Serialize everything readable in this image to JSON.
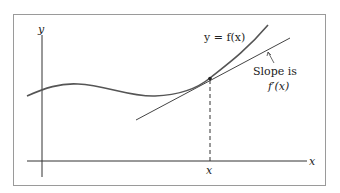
{
  "diagram": {
    "type": "tangent-line-illustration",
    "curve_label": "y = f(x)",
    "tangent_label_line1": "Slope is",
    "tangent_label_line2": "f′(x)",
    "x_axis_label": "x",
    "y_axis_label": "y",
    "x_tick_label": "x",
    "colors": {
      "frame": "#9a9a9a",
      "axes": "#333333",
      "curve": "#555555",
      "tangent": "#444444"
    }
  }
}
